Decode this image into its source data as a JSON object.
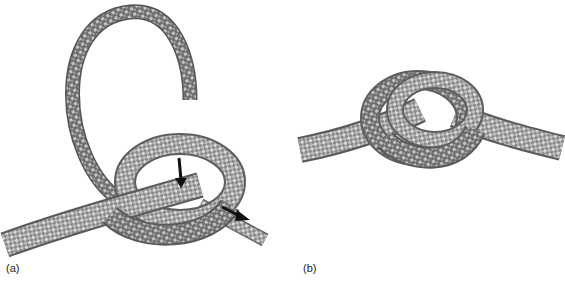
{
  "figure": {
    "panels": [
      {
        "id": "a",
        "label": "(a)",
        "description": "Knot being tied: loose rope end curves overhead, arrows show direction of pulling"
      },
      {
        "id": "b",
        "label": "(b)",
        "description": "Finished knot"
      }
    ],
    "colors": {
      "rope_dark": "#6e6e6e",
      "rope_mid": "#9a9a9a",
      "rope_light": "#d8d8d8",
      "arrow": "#111111"
    },
    "arrows": [
      {
        "name": "down-arrow",
        "panel": "a"
      },
      {
        "name": "right-arrow",
        "panel": "a"
      }
    ]
  }
}
